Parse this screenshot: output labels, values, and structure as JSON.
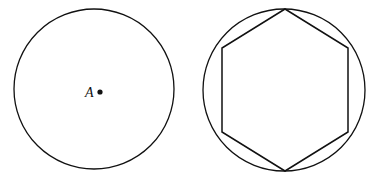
{
  "figure": {
    "background_color": "#ffffff",
    "stroke_color": "#111111",
    "width": 381,
    "height": 187,
    "panels": [
      {
        "name": "plain-circle-with-center-point",
        "shapes": [
          {
            "kind": "circle",
            "name": "circle-a",
            "cx": 94,
            "cy": 89,
            "r": 80,
            "stroke_width": 1.3
          }
        ],
        "points": [
          {
            "name": "center-point-a",
            "label": "A",
            "label_x": 85,
            "label_y": 97,
            "dot_cx": 100,
            "dot_cy": 92,
            "dot_r": 2.6
          }
        ]
      },
      {
        "name": "circle-with-inscribed-hexagon",
        "shapes": [
          {
            "kind": "circle",
            "name": "circumscribed-circle",
            "cx": 284,
            "cy": 90,
            "r": 81,
            "stroke_width": 1.3
          },
          {
            "kind": "polygon",
            "name": "inscribed-regular-hexagon",
            "sides": 6,
            "orientation": "pointy-top",
            "stroke_width": 1.5,
            "vertices": [
              [
                285,
                9
              ],
              [
                348,
                48
              ],
              [
                348,
                132
              ],
              [
                285,
                171
              ],
              [
                222,
                132
              ],
              [
                222,
                48
              ]
            ],
            "points_attr": "285,9 348,48 348,132 285,171 222,132 222,48"
          }
        ],
        "points": []
      }
    ]
  }
}
